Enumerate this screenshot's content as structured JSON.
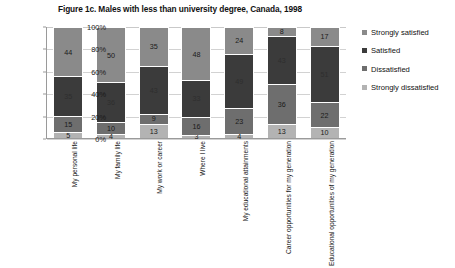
{
  "chart_data": {
    "type": "bar",
    "subtype": "stacked-percentage-column",
    "title": "Figure 1c. Males with less than university degree, Canada, 1998",
    "xlabel": "",
    "ylabel": "",
    "ylim": [
      0,
      100
    ],
    "yticks": [
      "0%",
      "20%",
      "40%",
      "60%",
      "80%",
      "100%"
    ],
    "ytick_values": [
      0,
      20,
      40,
      60,
      80,
      100
    ],
    "grid": true,
    "legend_position": "right",
    "categories": [
      "My personal life",
      "My family life",
      "My work or career",
      "Where I live",
      "My educational attainments",
      "Career opportunities for my generation",
      "Educational opportunities of my generation"
    ],
    "series": [
      {
        "name": "Strongly dissatisfied",
        "color": "#b3b3b3",
        "label_color": "#1a1a1a",
        "values": [
          5,
          4,
          13,
          3,
          4,
          13,
          10
        ]
      },
      {
        "name": "Dissatisfied",
        "color": "#6e6e6e",
        "label_color": "#1a1a1a",
        "values": [
          15,
          10,
          9,
          16,
          23,
          36,
          22
        ]
      },
      {
        "name": "Satisfied",
        "color": "#3b3b3b",
        "label_color": "#2e2e2e",
        "values": [
          35,
          36,
          43,
          33,
          49,
          43,
          51
        ]
      },
      {
        "name": "Strongly satisfied",
        "color": "#8a8a8a",
        "label_color": "#1a1a1a",
        "values": [
          44,
          50,
          35,
          48,
          24,
          8,
          17
        ]
      }
    ]
  },
  "legend": {
    "entries": [
      {
        "label": "Strongly satisfied",
        "color": "#8a8a8a"
      },
      {
        "label": "Satisfied",
        "color": "#3b3b3b"
      },
      {
        "label": "Dissatisfied",
        "color": "#6e6e6e"
      },
      {
        "label": "Strongly dissatisfied",
        "color": "#b3b3b3"
      }
    ]
  }
}
